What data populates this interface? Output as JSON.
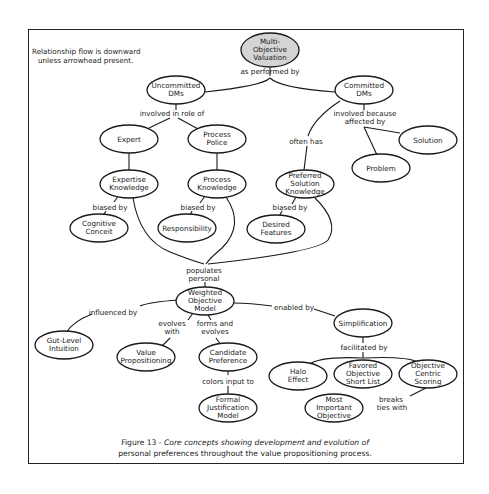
{
  "legend": {
    "line1": "Relationship flow is downward",
    "line2": "unless arrowhead present."
  },
  "nodes": {
    "multi_objective_valuation": {
      "lines": [
        "Multi-",
        "Objective",
        "Valuation"
      ],
      "fill": "#d4d4d4"
    },
    "uncommitted_dms": {
      "lines": [
        "Uncommitted",
        "DMs"
      ]
    },
    "committed_dms": {
      "lines": [
        "Committed",
        "DMs"
      ]
    },
    "expert": {
      "lines": [
        "Expert"
      ]
    },
    "process_police": {
      "lines": [
        "Process",
        "Police"
      ]
    },
    "solution": {
      "lines": [
        "Solution"
      ]
    },
    "problem": {
      "lines": [
        "Problem"
      ]
    },
    "expertise_knowledge": {
      "lines": [
        "Expertise",
        "Knowledge"
      ]
    },
    "process_knowledge": {
      "lines": [
        "Process",
        "Knowledge"
      ]
    },
    "preferred_solution_knowledge": {
      "lines": [
        "Preferred",
        "Solution",
        "Knowledge"
      ]
    },
    "cognitive_conceit": {
      "lines": [
        "Cognitive",
        "Conceit"
      ]
    },
    "responsibility": {
      "lines": [
        "Responsibility"
      ]
    },
    "desired_features": {
      "lines": [
        "Desired",
        "Features"
      ]
    },
    "weighted_objective_model": {
      "lines": [
        "Weighted",
        "Objective",
        "Model"
      ]
    },
    "simplification": {
      "lines": [
        "Simplification"
      ]
    },
    "gut_level_intuition": {
      "lines": [
        "Gut-Level",
        "Intuition"
      ]
    },
    "value_propositioning": {
      "lines": [
        "Value",
        "Propositioning"
      ]
    },
    "candidate_preference": {
      "lines": [
        "Candidate",
        "Preference"
      ]
    },
    "halo_effect": {
      "lines": [
        "Halo",
        "Effect"
      ]
    },
    "favored_objective_short_list": {
      "lines": [
        "Favored",
        "Objective",
        "Short List"
      ]
    },
    "objective_centric_scoring": {
      "lines": [
        "Objective",
        "Centric",
        "Scoring"
      ]
    },
    "formal_justification_model": {
      "lines": [
        "Formal",
        "Justification",
        "Model"
      ]
    },
    "most_important_objective": {
      "lines": [
        "Most",
        "Important",
        "Objective"
      ]
    }
  },
  "links": {
    "as_performed_by": {
      "lines": [
        "as performed by"
      ]
    },
    "involved_in_role_of": {
      "lines": [
        "involved in role of"
      ]
    },
    "involved_because_affected_by": {
      "lines": [
        "involved because",
        "affected by"
      ]
    },
    "often_has": {
      "lines": [
        "often has"
      ]
    },
    "biased_by_1": {
      "lines": [
        "biased by"
      ]
    },
    "biased_by_2": {
      "lines": [
        "biased by"
      ]
    },
    "biased_by_3": {
      "lines": [
        "biased by"
      ]
    },
    "populates_personal": {
      "lines": [
        "populates",
        "personal"
      ]
    },
    "influenced_by": {
      "lines": [
        "influenced by"
      ]
    },
    "evolves_with": {
      "lines": [
        "evolves",
        "with"
      ]
    },
    "forms_and_evolves": {
      "lines": [
        "forms and",
        "evolves"
      ]
    },
    "enabled_by": {
      "lines": [
        "enabled by"
      ]
    },
    "facilitated_by": {
      "lines": [
        "facilitated by"
      ]
    },
    "colors_input_to": {
      "lines": [
        "colors input to"
      ]
    },
    "breaks_ties_with": {
      "lines": [
        "breaks",
        "ties with"
      ]
    }
  },
  "caption": {
    "prefix": "Figure 13 - ",
    "line1_rest": "Core concepts showing development and evolution of",
    "line2": "personal preferences throughout the value propositioning process."
  }
}
